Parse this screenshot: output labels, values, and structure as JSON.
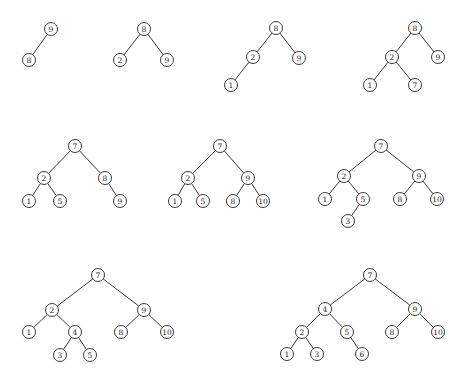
{
  "diagram": {
    "title": "",
    "node_radius": 6.5,
    "colors": {
      "stroke": "#3a3a3a",
      "text": "#222222",
      "background": "#ffffff"
    },
    "trees": [
      {
        "id": "tree-1",
        "nodes": [
          {
            "id": "a",
            "label": "9",
            "x": 51,
            "y": 29
          },
          {
            "id": "b",
            "label": "8",
            "x": 29,
            "y": 60
          }
        ],
        "edges": [
          [
            "a",
            "b"
          ]
        ]
      },
      {
        "id": "tree-2",
        "nodes": [
          {
            "id": "a",
            "label": "8",
            "x": 144,
            "y": 29
          },
          {
            "id": "b",
            "label": "2",
            "x": 120,
            "y": 60
          },
          {
            "id": "c",
            "label": "9",
            "x": 167,
            "y": 60
          }
        ],
        "edges": [
          [
            "a",
            "b"
          ],
          [
            "a",
            "c"
          ]
        ]
      },
      {
        "id": "tree-3",
        "nodes": [
          {
            "id": "a",
            "label": "8",
            "x": 276,
            "y": 28
          },
          {
            "id": "b",
            "label": "2",
            "x": 253,
            "y": 57
          },
          {
            "id": "c",
            "label": "9",
            "x": 299,
            "y": 58
          },
          {
            "id": "d",
            "label": "1",
            "x": 231,
            "y": 85
          }
        ],
        "edges": [
          [
            "a",
            "b"
          ],
          [
            "a",
            "c"
          ],
          [
            "b",
            "d"
          ]
        ]
      },
      {
        "id": "tree-4",
        "nodes": [
          {
            "id": "a",
            "label": "8",
            "x": 415,
            "y": 28
          },
          {
            "id": "b",
            "label": "2",
            "x": 392,
            "y": 57
          },
          {
            "id": "c",
            "label": "9",
            "x": 438,
            "y": 57
          },
          {
            "id": "d",
            "label": "1",
            "x": 370,
            "y": 85
          },
          {
            "id": "e",
            "label": "7",
            "x": 415,
            "y": 85
          }
        ],
        "edges": [
          [
            "a",
            "b"
          ],
          [
            "a",
            "c"
          ],
          [
            "b",
            "d"
          ],
          [
            "b",
            "e"
          ]
        ]
      },
      {
        "id": "tree-5",
        "nodes": [
          {
            "id": "a",
            "label": "7",
            "x": 75,
            "y": 146
          },
          {
            "id": "b",
            "label": "2",
            "x": 44,
            "y": 178
          },
          {
            "id": "c",
            "label": "8",
            "x": 105,
            "y": 178
          },
          {
            "id": "d",
            "label": "1",
            "x": 29,
            "y": 201
          },
          {
            "id": "e",
            "label": "5",
            "x": 60,
            "y": 201
          },
          {
            "id": "f",
            "label": "9",
            "x": 120,
            "y": 201
          }
        ],
        "edges": [
          [
            "a",
            "b"
          ],
          [
            "a",
            "c"
          ],
          [
            "b",
            "d"
          ],
          [
            "b",
            "e"
          ],
          [
            "c",
            "f"
          ]
        ]
      },
      {
        "id": "tree-6",
        "nodes": [
          {
            "id": "a",
            "label": "7",
            "x": 220,
            "y": 146
          },
          {
            "id": "b",
            "label": "2",
            "x": 188,
            "y": 178
          },
          {
            "id": "c",
            "label": "9",
            "x": 248,
            "y": 178
          },
          {
            "id": "d",
            "label": "1",
            "x": 175,
            "y": 201
          },
          {
            "id": "e",
            "label": "5",
            "x": 203,
            "y": 201
          },
          {
            "id": "f",
            "label": "8",
            "x": 233,
            "y": 201
          },
          {
            "id": "g",
            "label": "10",
            "x": 263,
            "y": 201
          }
        ],
        "edges": [
          [
            "a",
            "b"
          ],
          [
            "a",
            "c"
          ],
          [
            "b",
            "d"
          ],
          [
            "b",
            "e"
          ],
          [
            "c",
            "f"
          ],
          [
            "c",
            "g"
          ]
        ]
      },
      {
        "id": "tree-7",
        "nodes": [
          {
            "id": "a",
            "label": "7",
            "x": 381,
            "y": 146
          },
          {
            "id": "b",
            "label": "2",
            "x": 344,
            "y": 176
          },
          {
            "id": "c",
            "label": "9",
            "x": 419,
            "y": 176
          },
          {
            "id": "d",
            "label": "1",
            "x": 325,
            "y": 199
          },
          {
            "id": "e",
            "label": "5",
            "x": 363,
            "y": 199
          },
          {
            "id": "f",
            "label": "8",
            "x": 400,
            "y": 199
          },
          {
            "id": "g",
            "label": "10",
            "x": 437,
            "y": 199
          },
          {
            "id": "h",
            "label": "3",
            "x": 348,
            "y": 221
          }
        ],
        "edges": [
          [
            "a",
            "b"
          ],
          [
            "a",
            "c"
          ],
          [
            "b",
            "d"
          ],
          [
            "b",
            "e"
          ],
          [
            "c",
            "f"
          ],
          [
            "c",
            "g"
          ],
          [
            "e",
            "h"
          ]
        ]
      },
      {
        "id": "tree-8",
        "nodes": [
          {
            "id": "a",
            "label": "7",
            "x": 98,
            "y": 275
          },
          {
            "id": "b",
            "label": "2",
            "x": 52,
            "y": 310
          },
          {
            "id": "c",
            "label": "9",
            "x": 144,
            "y": 310
          },
          {
            "id": "d",
            "label": "1",
            "x": 29,
            "y": 332
          },
          {
            "id": "e",
            "label": "4",
            "x": 75,
            "y": 332
          },
          {
            "id": "f",
            "label": "8",
            "x": 121,
            "y": 332
          },
          {
            "id": "g",
            "label": "10",
            "x": 167,
            "y": 332
          },
          {
            "id": "h",
            "label": "3",
            "x": 60,
            "y": 355
          },
          {
            "id": "i",
            "label": "5",
            "x": 90,
            "y": 355
          }
        ],
        "edges": [
          [
            "a",
            "b"
          ],
          [
            "a",
            "c"
          ],
          [
            "b",
            "d"
          ],
          [
            "b",
            "e"
          ],
          [
            "c",
            "f"
          ],
          [
            "c",
            "g"
          ],
          [
            "e",
            "h"
          ],
          [
            "e",
            "i"
          ]
        ]
      },
      {
        "id": "tree-9",
        "nodes": [
          {
            "id": "a",
            "label": "7",
            "x": 370,
            "y": 275
          },
          {
            "id": "b",
            "label": "4",
            "x": 325,
            "y": 309
          },
          {
            "id": "c",
            "label": "9",
            "x": 415,
            "y": 309
          },
          {
            "id": "d",
            "label": "2",
            "x": 302,
            "y": 332
          },
          {
            "id": "e",
            "label": "5",
            "x": 347,
            "y": 332
          },
          {
            "id": "f",
            "label": "8",
            "x": 392,
            "y": 332
          },
          {
            "id": "g",
            "label": "10",
            "x": 438,
            "y": 332
          },
          {
            "id": "h",
            "label": "1",
            "x": 287,
            "y": 354
          },
          {
            "id": "i",
            "label": "3",
            "x": 317,
            "y": 354
          },
          {
            "id": "j",
            "label": "6",
            "x": 362,
            "y": 354
          }
        ],
        "edges": [
          [
            "a",
            "b"
          ],
          [
            "a",
            "c"
          ],
          [
            "b",
            "d"
          ],
          [
            "b",
            "e"
          ],
          [
            "c",
            "f"
          ],
          [
            "c",
            "g"
          ],
          [
            "d",
            "h"
          ],
          [
            "d",
            "i"
          ],
          [
            "e",
            "j"
          ]
        ]
      }
    ]
  }
}
